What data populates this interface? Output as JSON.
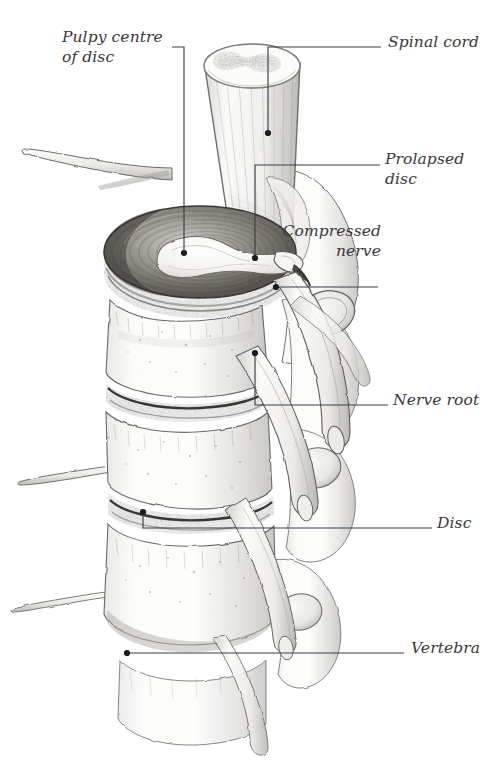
{
  "figure": {
    "width": 499,
    "height": 762,
    "background_color": "#ffffff",
    "ink_color": "#39383c",
    "leader_color": "#3d3d42",
    "style": "pencil-drawing"
  },
  "callouts": [
    {
      "id": "pulpy-centre",
      "label": "Pulpy centre\nof disc",
      "align": "left",
      "text_x": 62,
      "text_y": 28,
      "leader": "M 172 47 L 184 47 L 184 253",
      "dot_x": 184,
      "dot_y": 253
    },
    {
      "id": "spinal-cord",
      "label": "Spinal cord",
      "align": "left",
      "text_x": 388,
      "text_y": 33,
      "leader": "M 381 47 L 268 47 L 268 133",
      "dot_x": 268,
      "dot_y": 133
    },
    {
      "id": "prolapsed-disc",
      "label": "Prolapsed disc",
      "align": "left",
      "text_x": 385,
      "text_y": 150,
      "leader": "M 380 165 L 255 165 L 255 258",
      "dot_x": 255,
      "dot_y": 258
    },
    {
      "id": "compressed-nerve",
      "label": "Compressed\nnerve",
      "align": "right",
      "text_x": 381,
      "text_y": 222,
      "leader": "M 378 287 L 276 287",
      "dot_x": 276,
      "dot_y": 287
    },
    {
      "id": "nerve-root",
      "label": "Nerve root",
      "align": "left",
      "text_x": 393,
      "text_y": 391,
      "leader": "M 388 405 L 255 405 L 255 353",
      "dot_x": 255,
      "dot_y": 353
    },
    {
      "id": "disc",
      "label": "Disc",
      "align": "left",
      "text_x": 437,
      "text_y": 514,
      "leader": "M 432 528 L 143 528 L 143 512",
      "dot_x": 143,
      "dot_y": 512
    },
    {
      "id": "vertebra",
      "label": "Vertebra",
      "align": "left",
      "text_x": 411,
      "text_y": 639,
      "leader": "M 404 653 L 127 653",
      "dot_x": 127,
      "dot_y": 653
    }
  ],
  "anatomy": {
    "spinal_cord": {
      "name": "Spinal cord",
      "description": "Cut cylinder of cord descending from above, showing butterfly-shaped grey matter on the cut surface"
    },
    "prolapsed_disc": {
      "name": "Prolapsed disc",
      "description": "Topmost intervertebral disc cut horizontally, concentric annulus fibrosus lamellae with nucleus pulposus extruded posteriorly"
    },
    "vertebral_bodies": {
      "name": "Vertebra",
      "count": 4,
      "description": "Stacked lumbar vertebral bodies drawn in pencil with cancellous stippling"
    },
    "discs": {
      "name": "Disc",
      "count": 3,
      "description": "Dark banded intervertebral discs between vertebral bodies"
    },
    "nerve_roots": {
      "name": "Nerve root",
      "count": 4,
      "description": "Pale tubular nerve roots emerging from intervertebral foramina and running inferolaterally with cut rounded ends"
    },
    "transverse_processes": {
      "name": "Transverse process",
      "count": 3,
      "description": "Wing-like bony processes projecting laterally to the left"
    },
    "facet_joints": {
      "name": "Facet joint",
      "count": 3,
      "description": "Oval articular facets on the posterior right of the column"
    }
  }
}
